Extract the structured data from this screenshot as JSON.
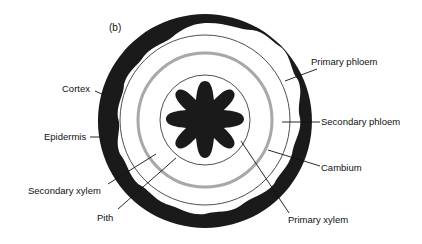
{
  "figure": {
    "panel_label": "(b)"
  },
  "labels": {
    "cortex": "Cortex",
    "epidermis": "Epidermis",
    "secondary_xylem": "Secondary xylem",
    "pith": "Pith",
    "primary_phloem": "Primary phloem",
    "secondary_phloem": "Secondary phloem",
    "cambium": "Cambium",
    "primary_xylem": "Primary xylem"
  },
  "colors": {
    "dark_tissue": "#1a1a1a",
    "cambium_ring": "#a8a8a8",
    "outline": "#222222",
    "background": "#ffffff"
  }
}
